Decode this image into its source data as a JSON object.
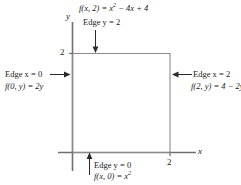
{
  "figure": {
    "axes": {
      "x_label": "x",
      "y_label": "y",
      "x_tick_label": "2",
      "y_tick_label": "2"
    },
    "region": {
      "shape": "square",
      "x_range": [
        0,
        2
      ],
      "y_range": [
        0,
        2
      ]
    },
    "annotations": {
      "top": {
        "formula_prefix": "f(x, 2) = x",
        "formula_exponent": "2",
        "formula_suffix": " − 4x + 4",
        "edge_label": "Edge y = 2",
        "arrow": "down-arrow"
      },
      "left": {
        "edge_label": "Edge x = 0",
        "formula": "f(0, y) = 2y",
        "arrow": "right-arrow"
      },
      "right": {
        "edge_label": "Edge x = 2",
        "formula": "f(2, y) = 4 − 2y",
        "arrow": "left-arrow"
      },
      "bottom": {
        "edge_label": "Edge y = 0",
        "formula_prefix": "f(x, 0) = x",
        "formula_exponent": "2",
        "arrow": "up-arrow"
      }
    },
    "colors": {
      "axis": "#707070",
      "square": "#8a8a8a",
      "text": "#1a1a1a",
      "background": "#ffffff"
    }
  }
}
